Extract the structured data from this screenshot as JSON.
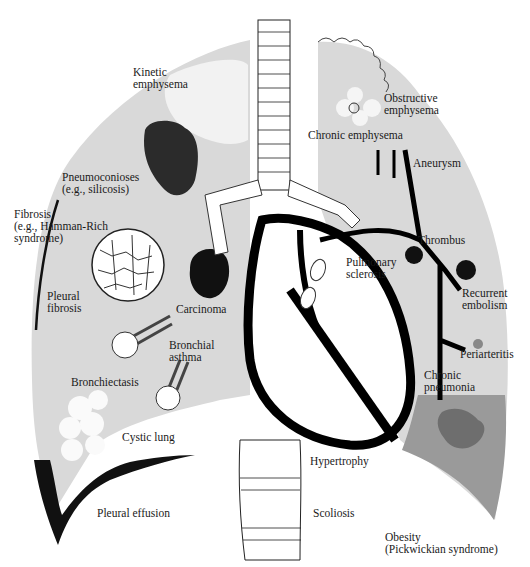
{
  "figure": {
    "colors": {
      "lung_fill": "#d9d9d9",
      "dark_region": "#9a9a9a",
      "dark_patch": "#6e6e6e",
      "ink": "#111111",
      "background": "#ffffff"
    }
  },
  "labels": {
    "kinetic_emphysema": "Kinetic\nemphysema",
    "obstructive_emphysema": "Obstructive\nemphysema",
    "chronic_emphysema": "Chronic emphysema",
    "aneurysm": "Aneurysm",
    "pneumoconioses": "Pneumoconioses\n(e.g., silicosis)",
    "fibrosis": "Fibrosis\n(e.g., Hamman-Rich\nsyndrome)",
    "thrombus": "Thrombus",
    "pulmonary_sclerosis": "Pulmonary\nsclerosis",
    "recurrent_embolism": "Recurrent\nembolism",
    "pleural_fibrosis": "Pleural\nfibrosis",
    "carcinoma": "Carcinoma",
    "bronchial_asthma": "Bronchial\nasthma",
    "periarteritis": "Periarteritis",
    "chronic_pneumonia": "Chronic\npneumonia",
    "bronchiectasis": "Bronchiectasis",
    "cystic_lung": "Cystic lung",
    "hypertrophy": "Hypertrophy",
    "pleural_effusion": "Pleural effusion",
    "scoliosis": "Scoliosis",
    "obesity": "Obesity\n(Pickwickian syndrome)"
  }
}
